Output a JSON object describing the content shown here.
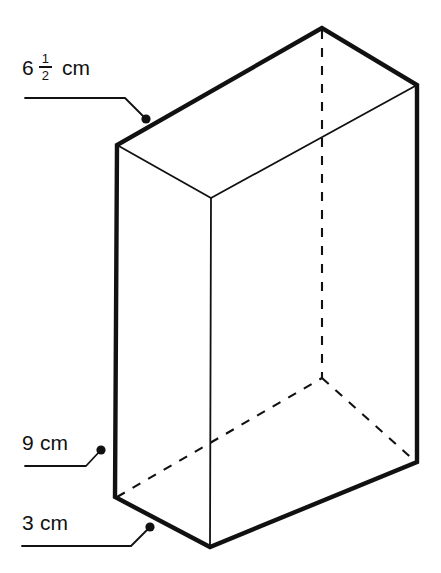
{
  "figure": {
    "type": "rectangular-prism-isometric",
    "colors": {
      "stroke": "#111111",
      "background": "#ffffff",
      "hidden_edge": "#111111"
    },
    "line_weights": {
      "outline": 4.2,
      "interior": 1.6,
      "leader": 1.6,
      "hidden": 1.8
    },
    "vertices": {
      "top_back": [
        322,
        28
      ],
      "top_left": [
        117,
        145
      ],
      "top_front": [
        211,
        198
      ],
      "top_right": [
        417,
        85
      ],
      "bottom_left": [
        115,
        497
      ],
      "bottom_front": [
        210,
        547
      ],
      "bottom_right": [
        417,
        462
      ],
      "bottom_back_hidden": [
        322,
        378
      ]
    },
    "outline_path": "M 322 28 L 117 145 L 115 497 L 210 547 L 417 462 L 417 85 Z",
    "interior_edges": [
      {
        "name": "front-vertical-edge",
        "from": [
          211,
          198
        ],
        "to": [
          210,
          547
        ]
      },
      {
        "name": "top-face-left-edge",
        "from": [
          117,
          145
        ],
        "to": [
          211,
          198
        ]
      },
      {
        "name": "top-face-right-edge",
        "from": [
          211,
          198
        ],
        "to": [
          417,
          85
        ]
      }
    ],
    "hidden_edges": [
      {
        "name": "back-vertical-hidden-edge",
        "from": [
          322,
          28
        ],
        "to": [
          322,
          378
        ]
      },
      {
        "name": "bottom-back-left-hidden-edge",
        "from": [
          115,
          497
        ],
        "to": [
          322,
          378
        ]
      },
      {
        "name": "bottom-back-right-hidden-edge",
        "from": [
          322,
          378
        ],
        "to": [
          417,
          462
        ]
      }
    ]
  },
  "labels": {
    "depth": {
      "whole": "6",
      "numerator": "1",
      "denominator": "2",
      "unit": "cm",
      "full_text": "6 1/2 cm",
      "value": 6.5,
      "leader": {
        "polyline": "25,98 125,98 145,118",
        "dot": [
          146,
          119
        ],
        "dot_radius": 4.5
      }
    },
    "height": {
      "text": "9 cm",
      "value": 9,
      "unit": "cm",
      "leader": {
        "polyline": "25,466 86,466 100,451",
        "dot": [
          101,
          450
        ],
        "dot_radius": 4.5
      }
    },
    "width": {
      "text": "3 cm",
      "value": 3,
      "unit": "cm",
      "leader": {
        "polyline": "22,546 131,546 149,528",
        "dot": [
          150,
          527
        ],
        "dot_radius": 4.5
      }
    }
  }
}
